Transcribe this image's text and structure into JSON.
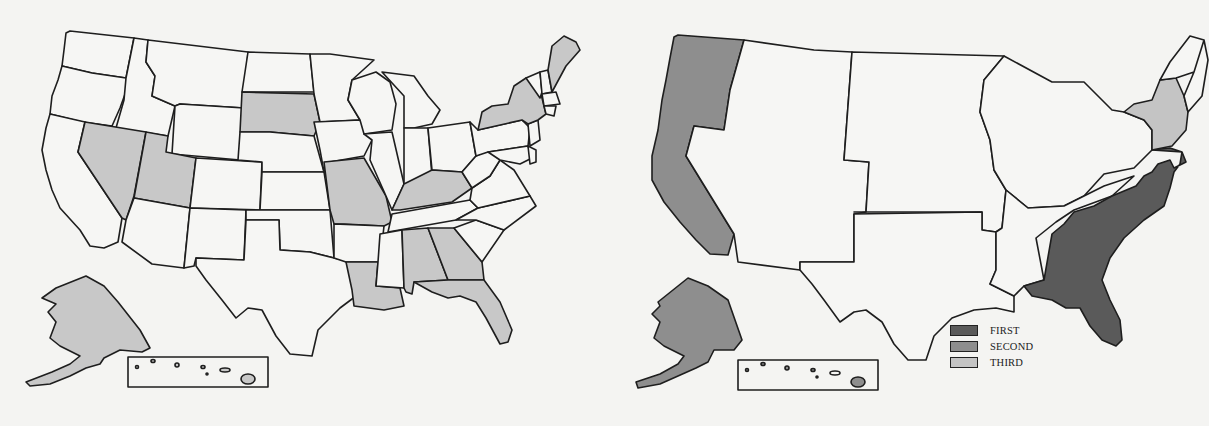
{
  "colors": {
    "background": "#f4f4f2",
    "outline": "#1e1e1e",
    "unshaded": "#f6f6f4",
    "shaded_light": "#c8c8c8",
    "first": "#5a5a5a",
    "second": "#8e8e8e",
    "third": "#c4c4c4"
  },
  "left_map": {
    "description": "United States map with individual state boundaries",
    "shaded_states": [
      "Nevada",
      "Utah",
      "South Dakota",
      "Missouri",
      "Kentucky",
      "New York",
      "Maine",
      "Louisiana",
      "Alabama",
      "Georgia",
      "Florida",
      "Alaska",
      "Hawaii"
    ]
  },
  "right_map": {
    "description": "United States map grouped into regions",
    "regions": [
      {
        "name": "Pacific (WA, OR, CA, AK, HI)",
        "rank": "SECOND"
      },
      {
        "name": "South Atlantic",
        "rank": "FIRST"
      },
      {
        "name": "Middle Atlantic (NY, NJ, PA)",
        "rank": "THIRD"
      },
      {
        "name": "Mountain",
        "rank": "none"
      },
      {
        "name": "West North Central",
        "rank": "none"
      },
      {
        "name": "West South Central",
        "rank": "none"
      },
      {
        "name": "East North Central",
        "rank": "none"
      },
      {
        "name": "East South Central",
        "rank": "none"
      },
      {
        "name": "New England",
        "rank": "none"
      }
    ]
  },
  "legend": {
    "items": [
      {
        "label": "FIRST",
        "color": "#5a5a5a"
      },
      {
        "label": "SECOND",
        "color": "#8e8e8e"
      },
      {
        "label": "THIRD",
        "color": "#c4c4c4"
      }
    ]
  }
}
